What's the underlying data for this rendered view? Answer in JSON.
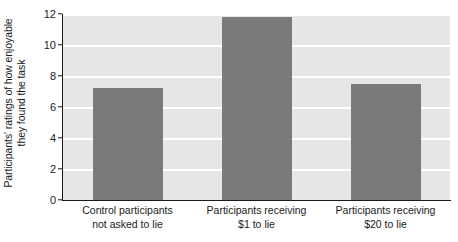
{
  "chart_data": {
    "type": "bar",
    "title": "",
    "subtitle": "",
    "xlabel": "",
    "ylabel": "Participants' ratings of how enjoyable they found the task",
    "ylabel_line1": "Participants' ratings of how enjoyable",
    "ylabel_line2": "they found the task",
    "categories": [
      "Control participants not asked to lie",
      "Participants receiving $1 to lie",
      "Participants receiving $20 to lie"
    ],
    "category_lines": [
      {
        "line1": "Control participants",
        "line2": "not asked to lie"
      },
      {
        "line1": "Participants receiving",
        "line2": "$1 to lie"
      },
      {
        "line1": "Participants receiving",
        "line2": "$20 to lie"
      }
    ],
    "values": [
      7.2,
      11.8,
      7.5
    ],
    "ylim": [
      0,
      12
    ],
    "yticks": [
      0,
      2,
      4,
      6,
      8,
      10,
      12
    ],
    "ytick_labels": [
      "0",
      "2",
      "4",
      "6",
      "8",
      "10",
      "12"
    ],
    "grid": true,
    "grid_axis": "y",
    "legend": false,
    "legend_position": "none",
    "bar_color": "#7a7a7a",
    "plot_background": "#e6e6e6",
    "gridline_color": "#ffffff",
    "axis_color": "#1a1a1a",
    "figure_background": "#ffffff"
  }
}
